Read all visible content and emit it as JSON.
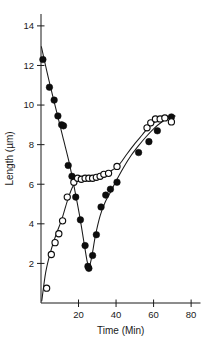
{
  "chart_data": {
    "type": "scatter",
    "title": "",
    "xlabel": "Time (Min)",
    "ylabel": "Length (µm)",
    "xlim": [
      0,
      85
    ],
    "ylim": [
      0,
      14.6
    ],
    "xticks": [
      20,
      40,
      60,
      80
    ],
    "yticks": [
      2,
      4,
      6,
      8,
      10,
      12,
      14
    ],
    "xtick_labels": [
      "20",
      "40",
      "60",
      "80"
    ],
    "ytick_labels": [
      "2",
      "4",
      "6",
      "8",
      "10",
      "12",
      "14"
    ],
    "grid": false,
    "legend": false,
    "legend_position": "none",
    "marker_color": "#0d0d0d",
    "curve_color": "#1a1a1a",
    "background": "#ffffff",
    "series": [
      {
        "name": "filled-circles",
        "marker": "filled-circle",
        "x": [
          1.0,
          4.5,
          7.0,
          9.0,
          11.0,
          12.0,
          14.5,
          16.5,
          18.5,
          21.0,
          23.5,
          25.0,
          25.5,
          27.5,
          29.5,
          32.0,
          34.5,
          37.0,
          40.5,
          52.0,
          57.5,
          62.0,
          69.5
        ],
        "y": [
          12.3,
          10.9,
          10.25,
          9.45,
          9.0,
          8.95,
          6.95,
          6.4,
          5.35,
          4.2,
          2.9,
          1.85,
          1.75,
          2.4,
          3.45,
          4.85,
          5.45,
          5.75,
          6.1,
          7.6,
          8.15,
          8.7,
          9.4
        ]
      },
      {
        "name": "open-circles",
        "marker": "open-circle",
        "x": [
          3.0,
          5.5,
          7.5,
          9.5,
          11.5,
          14.0,
          17.5,
          19.5,
          21.5,
          23.5,
          25.5,
          27.5,
          29.5,
          31.5,
          33.5,
          36.0,
          40.5,
          56.5,
          58.5,
          61.0,
          63.5,
          66.0,
          69.5
        ],
        "y": [
          0.75,
          2.45,
          3.05,
          3.5,
          4.15,
          5.35,
          6.1,
          6.3,
          6.25,
          6.3,
          6.3,
          6.3,
          6.35,
          6.4,
          6.5,
          6.55,
          6.9,
          8.85,
          9.1,
          9.3,
          9.3,
          9.35,
          9.15
        ]
      }
    ],
    "fit_curves": [
      {
        "name": "filled-fit",
        "x": [
          0.2,
          3.0,
          6.0,
          9.0,
          12.0,
          15.0,
          18.0,
          20.5,
          23.0,
          24.6,
          25.6,
          27.0,
          29.0,
          31.5,
          34.0,
          37.0,
          40.5,
          44.0,
          48.0,
          52.0,
          56.0,
          60.0,
          64.0,
          68.0,
          71.0
        ],
        "y": [
          12.95,
          11.75,
          10.55,
          9.4,
          8.25,
          7.1,
          5.7,
          4.45,
          3.0,
          2.1,
          1.8,
          2.3,
          3.4,
          4.4,
          5.05,
          5.6,
          6.25,
          6.85,
          7.45,
          7.95,
          8.4,
          8.8,
          9.12,
          9.35,
          9.45
        ]
      },
      {
        "name": "open-fit",
        "x": [
          0.4,
          2.5,
          5.0,
          8.0,
          11.0,
          14.0,
          16.5,
          18.5,
          21.0,
          24.0,
          27.0,
          30.0,
          33.0,
          36.0,
          38.5,
          40.8,
          43.0,
          46.0,
          50.0,
          54.0,
          58.0,
          62.0,
          66.0,
          70.0,
          71.5
        ],
        "y": [
          0.1,
          1.55,
          2.55,
          3.45,
          4.2,
          5.15,
          5.8,
          6.1,
          6.2,
          6.25,
          6.3,
          6.35,
          6.45,
          6.6,
          6.75,
          6.9,
          7.15,
          7.55,
          8.05,
          8.5,
          8.95,
          9.2,
          9.35,
          9.45,
          9.45
        ]
      }
    ]
  }
}
